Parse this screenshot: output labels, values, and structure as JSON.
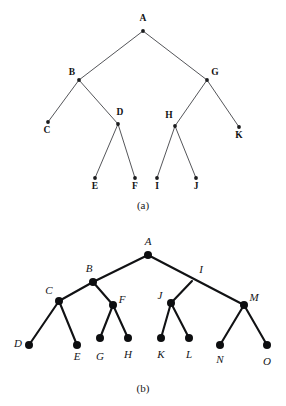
{
  "figure": {
    "colors": {
      "background": "#ffffff",
      "edge_top": "#55565a",
      "edge_bottom": "#111214",
      "node": "#0d0e10",
      "text": "#141518"
    }
  },
  "panel_a": {
    "caption": "(a)",
    "caption_x": 143,
    "caption_y": 209,
    "dot_radius": 1.9,
    "nodes": [
      {
        "id": "A",
        "label": "A",
        "x": 143,
        "y": 31,
        "label_x": 143,
        "label_y": 21,
        "anchor": "middle"
      },
      {
        "id": "B",
        "label": "B",
        "x": 79,
        "y": 80,
        "label_x": 72,
        "label_y": 75,
        "anchor": "middle"
      },
      {
        "id": "G",
        "label": "G",
        "x": 207,
        "y": 80,
        "label_x": 215,
        "label_y": 75,
        "anchor": "middle"
      },
      {
        "id": "C",
        "label": "C",
        "x": 48,
        "y": 122,
        "label_x": 47,
        "label_y": 133,
        "anchor": "middle"
      },
      {
        "id": "D",
        "label": "D",
        "x": 118,
        "y": 124,
        "label_x": 120,
        "label_y": 115,
        "anchor": "middle"
      },
      {
        "id": "H",
        "label": "H",
        "x": 175,
        "y": 126,
        "label_x": 169,
        "label_y": 118,
        "anchor": "middle"
      },
      {
        "id": "K",
        "label": "K",
        "x": 239,
        "y": 127,
        "label_x": 239,
        "label_y": 138,
        "anchor": "middle"
      },
      {
        "id": "E",
        "label": "E",
        "x": 95,
        "y": 178,
        "label_x": 95,
        "label_y": 189,
        "anchor": "middle"
      },
      {
        "id": "F",
        "label": "F",
        "x": 135,
        "y": 178,
        "label_x": 135,
        "label_y": 189,
        "anchor": "middle"
      },
      {
        "id": "I",
        "label": "I",
        "x": 157,
        "y": 178,
        "label_x": 157,
        "label_y": 189,
        "anchor": "middle"
      },
      {
        "id": "J",
        "label": "J",
        "x": 196,
        "y": 178,
        "label_x": 196,
        "label_y": 189,
        "anchor": "middle"
      }
    ],
    "edges": [
      {
        "from": "A",
        "to": "B"
      },
      {
        "from": "A",
        "to": "G"
      },
      {
        "from": "B",
        "to": "C"
      },
      {
        "from": "B",
        "to": "D"
      },
      {
        "from": "G",
        "to": "H"
      },
      {
        "from": "G",
        "to": "K"
      },
      {
        "from": "D",
        "to": "E"
      },
      {
        "from": "D",
        "to": "F"
      },
      {
        "from": "H",
        "to": "I"
      },
      {
        "from": "H",
        "to": "J"
      }
    ]
  },
  "panel_b": {
    "caption": "(b)",
    "caption_x": 143,
    "caption_y": 392,
    "dot_radius": 4.0,
    "nodes": [
      {
        "id": "A",
        "label": "A",
        "x": 148,
        "y": 255,
        "label_x": 148,
        "label_y": 245,
        "anchor": "middle",
        "dot": true
      },
      {
        "id": "B",
        "label": "B",
        "x": 93,
        "y": 282,
        "label_x": 89,
        "label_y": 272,
        "anchor": "middle",
        "dot": true
      },
      {
        "id": "I",
        "label": "I",
        "x": 192,
        "y": 281,
        "label_x": 201,
        "label_y": 273,
        "anchor": "middle",
        "dot": false
      },
      {
        "id": "C",
        "label": "C",
        "x": 59,
        "y": 301,
        "label_x": 49,
        "label_y": 294,
        "anchor": "middle",
        "dot": true
      },
      {
        "id": "F",
        "label": "F",
        "x": 113,
        "y": 305,
        "label_x": 122,
        "label_y": 303,
        "anchor": "middle",
        "dot": true
      },
      {
        "id": "J",
        "label": "J",
        "x": 171,
        "y": 303,
        "label_x": 160,
        "label_y": 299,
        "anchor": "middle",
        "dot": true
      },
      {
        "id": "M",
        "label": "M",
        "x": 244,
        "y": 305,
        "label_x": 254,
        "label_y": 301,
        "anchor": "middle",
        "dot": true
      },
      {
        "id": "D",
        "label": "D",
        "x": 29,
        "y": 345,
        "label_x": 18,
        "label_y": 347,
        "anchor": "middle",
        "dot": true
      },
      {
        "id": "E",
        "label": "E",
        "x": 77,
        "y": 345,
        "label_x": 77,
        "label_y": 360,
        "anchor": "middle",
        "dot": true
      },
      {
        "id": "G",
        "label": "G",
        "x": 100,
        "y": 338,
        "label_x": 100,
        "label_y": 360,
        "anchor": "middle",
        "dot": true
      },
      {
        "id": "H",
        "label": "H",
        "x": 128,
        "y": 338,
        "label_x": 128,
        "label_y": 358,
        "anchor": "middle",
        "dot": true
      },
      {
        "id": "K",
        "label": "K",
        "x": 161,
        "y": 338,
        "label_x": 161,
        "label_y": 358,
        "anchor": "middle",
        "dot": true
      },
      {
        "id": "L",
        "label": "L",
        "x": 189,
        "y": 338,
        "label_x": 189,
        "label_y": 358,
        "anchor": "middle",
        "dot": true
      },
      {
        "id": "N",
        "label": "N",
        "x": 220,
        "y": 345,
        "label_x": 220,
        "label_y": 363,
        "anchor": "middle",
        "dot": true
      },
      {
        "id": "O",
        "label": "O",
        "x": 267,
        "y": 345,
        "label_x": 267,
        "label_y": 365,
        "anchor": "middle",
        "dot": true
      }
    ],
    "edges": [
      {
        "from": "A",
        "to": "B"
      },
      {
        "from": "A",
        "to": "M"
      },
      {
        "from": "B",
        "to": "C"
      },
      {
        "from": "B",
        "to": "F"
      },
      {
        "from": "I",
        "to": "J"
      },
      {
        "from": "C",
        "to": "D"
      },
      {
        "from": "C",
        "to": "E"
      },
      {
        "from": "F",
        "to": "G"
      },
      {
        "from": "F",
        "to": "H"
      },
      {
        "from": "J",
        "to": "K"
      },
      {
        "from": "J",
        "to": "L"
      },
      {
        "from": "M",
        "to": "N"
      },
      {
        "from": "M",
        "to": "O"
      }
    ]
  }
}
